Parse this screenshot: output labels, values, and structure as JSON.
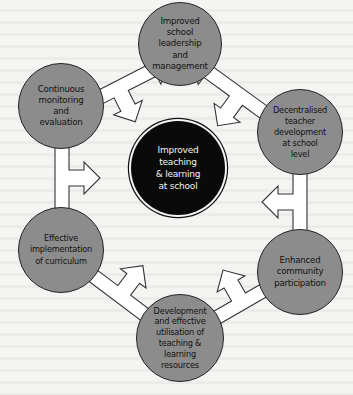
{
  "diagram": {
    "type": "cycle-with-hub",
    "center": {
      "label": "Improved\nteaching\n& learning\nat school"
    },
    "nodes": [
      {
        "id": "top",
        "label": "Improved\nschool\nleadership\nand\nmanagement"
      },
      {
        "id": "upper-right",
        "label": "Decentralised\nteacher\ndevelopment\nat school\nlevel"
      },
      {
        "id": "lower-right",
        "label": "Enhanced\ncommunity\nparticipation"
      },
      {
        "id": "bottom",
        "label": "Development\nand effective\nutilisation of\nteaching &\nlearning\nresources"
      },
      {
        "id": "lower-left",
        "label": "Effective\nimplementation\nof curriculum"
      },
      {
        "id": "upper-left",
        "label": "Continuous\nmonitoring\nand\nevaluation"
      }
    ],
    "connectors": [
      {
        "from": "upper-left",
        "to": "top",
        "hub": true
      },
      {
        "from": "top",
        "to": "upper-right",
        "hub": true
      },
      {
        "from": "upper-right",
        "to": "lower-right",
        "hub": true
      },
      {
        "from": "lower-right",
        "to": "bottom",
        "hub": true
      },
      {
        "from": "bottom",
        "to": "lower-left",
        "hub": true
      },
      {
        "from": "lower-left",
        "to": "upper-left",
        "hub": true
      }
    ],
    "colors": {
      "node_fill": "#8c8c8c",
      "center_fill": "#0a0a0a",
      "arrow_fill": "#ffffff",
      "outline": "#222222",
      "background": "#f4f4f2"
    }
  }
}
